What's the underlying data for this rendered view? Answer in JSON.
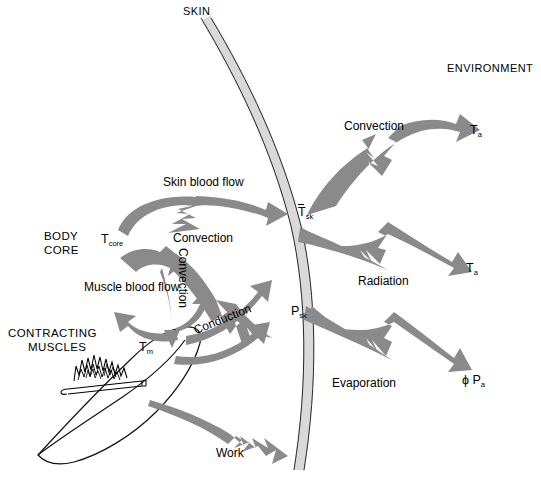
{
  "figure": {
    "type": "diagram",
    "background": "#ffffff",
    "colors": {
      "arrow_gray": "#8a8a8a",
      "skin_band_fill": "#d9d9d9",
      "outline": "#1a1a1a",
      "text": "#000000"
    }
  },
  "regions": {
    "skin_label": "SKIN",
    "environment_label": "ENVIRONMENT",
    "body_core_line1": "BODY",
    "body_core_line2": "CORE",
    "contracting_line1": "CONTRACTING",
    "contracting_line2": "MUSCLES"
  },
  "symbols": {
    "t_core": {
      "base": "T",
      "sub": "core"
    },
    "t_muscle": {
      "base": "T",
      "sub": "m"
    },
    "t_skin_mean": {
      "base": "T",
      "sub": "sk",
      "overbar": true
    },
    "p_skin": {
      "base": "P",
      "sub": "sk"
    },
    "t_air_convection": {
      "base": "T",
      "sub": "a"
    },
    "t_air_radiation": {
      "base": "T",
      "sub": "a"
    },
    "phi_p_air": {
      "prefix": "ϕ",
      "base": "P",
      "sub": "a"
    }
  },
  "flows": [
    {
      "id": "skin-blood-flow",
      "label": "Skin blood flow",
      "from": "body core",
      "to": "skin surface"
    },
    {
      "id": "convection-core",
      "label": "Convection",
      "from": "body core",
      "to": "skin"
    },
    {
      "id": "convection-vertical",
      "label": "Convection",
      "orientation": "vertical",
      "from": "core",
      "to": "muscle"
    },
    {
      "id": "muscle-blood-flow",
      "label": "Muscle blood flow",
      "from": "contracting muscles",
      "to": "body core"
    },
    {
      "id": "conduction",
      "label": "Conduction",
      "from": "muscle",
      "to": "skin"
    },
    {
      "id": "work",
      "label": "Work",
      "from": "contracting muscles",
      "to": "environment"
    },
    {
      "id": "convection-env",
      "label": "Convection",
      "from": "skin",
      "to": "air"
    },
    {
      "id": "radiation",
      "label": "Radiation",
      "from": "skin",
      "to": "surroundings"
    },
    {
      "id": "evaporation",
      "label": "Evaporation",
      "from": "skin",
      "to": "air"
    }
  ]
}
